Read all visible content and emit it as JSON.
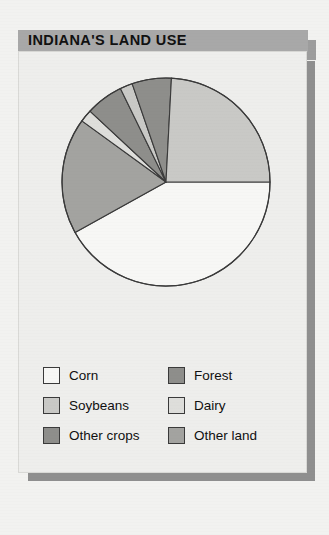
{
  "header": {
    "title": "INDIANA'S LAND USE"
  },
  "colors": {
    "page_background": "#f2f2f0",
    "panel_background": "#eeeeec",
    "title_bar": "#a8a8a8",
    "shadow": "#8f8f8f",
    "outline": "#3a3a3a",
    "corn": "#f4f4f2",
    "soybeans": "#cfcfcc",
    "other_crops": "#8e8e8b",
    "forest": "#8e8e8b",
    "dairy": "#dcdcd9",
    "other_land": "#a3a3a0"
  },
  "legend": {
    "rows": [
      [
        {
          "label": "Corn",
          "color": "#f7f7f5",
          "swatch_name": "legend-swatch-corn"
        },
        {
          "label": "Forest",
          "color": "#8e8e8b",
          "swatch_name": "legend-swatch-forest"
        }
      ],
      [
        {
          "label": "Soybeans",
          "color": "#c9c9c6",
          "swatch_name": "legend-swatch-soybeans"
        },
        {
          "label": "Dairy",
          "color": "#dedeDB",
          "swatch_name": "legend-swatch-dairy"
        }
      ],
      [
        {
          "label": "Other crops",
          "color": "#8e8e8b",
          "swatch_name": "legend-swatch-other-crops"
        },
        {
          "label": "Other land",
          "color": "#a3a3a0",
          "swatch_name": "legend-swatch-other-land"
        }
      ]
    ]
  },
  "chart_data": {
    "type": "pie",
    "title": "INDIANA'S LAND USE",
    "xlabel": "",
    "ylabel": "",
    "legend_position": "bottom",
    "grid": false,
    "start_angle_deg": 0,
    "direction": "clockwise",
    "categories": [
      "Corn",
      "Other land",
      "Dairy",
      "Other crops",
      "Soybeans",
      "Forest",
      "Soybeans"
    ],
    "slices": [
      {
        "label": "Corn",
        "percent": 42,
        "color": "#f7f7f5",
        "start_deg": 0,
        "end_deg": 151
      },
      {
        "label": "Other land",
        "percent": 18,
        "color": "#a3a3a0",
        "start_deg": 151,
        "end_deg": 216
      },
      {
        "label": "Dairy",
        "percent": 2,
        "color": "#dedeDB",
        "start_deg": 216,
        "end_deg": 223
      },
      {
        "label": "Other crops",
        "percent": 6,
        "color": "#8e8e8b",
        "start_deg": 223,
        "end_deg": 244
      },
      {
        "label": "Soybeans",
        "percent": 2,
        "color": "#c9c9c6",
        "start_deg": 244,
        "end_deg": 251
      },
      {
        "label": "Forest",
        "percent": 6,
        "color": "#8e8e8b",
        "start_deg": 251,
        "end_deg": 273
      },
      {
        "label": "Soybeans",
        "percent": 24,
        "color": "#c9c9c6",
        "start_deg": 273,
        "end_deg": 360
      }
    ],
    "values": [
      42,
      18,
      2,
      6,
      2,
      6,
      24
    ],
    "labels": [
      "Corn",
      "Other land",
      "Dairy",
      "Other crops",
      "Soybeans",
      "Forest",
      "Soybeans"
    ]
  }
}
